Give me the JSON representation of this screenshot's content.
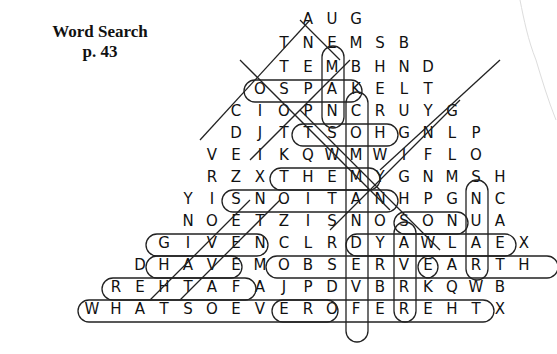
{
  "header": {
    "title": "Word Search",
    "page": "p. 43"
  },
  "puzzle": {
    "rows": [
      {
        "x": 296,
        "y": 8,
        "letters": [
          "A",
          "U",
          "G"
        ]
      },
      {
        "x": 272,
        "y": 32,
        "letters": [
          "T",
          "N",
          "E",
          "M",
          "S",
          "B"
        ]
      },
      {
        "x": 272,
        "y": 56,
        "letters": [
          "T",
          "E",
          "M",
          "B",
          "H",
          "N",
          "D"
        ]
      },
      {
        "x": 248,
        "y": 78,
        "letters": [
          "O",
          "S",
          "P",
          "A",
          "K",
          "E",
          "L",
          "T"
        ]
      },
      {
        "x": 224,
        "y": 100,
        "letters": [
          "C",
          "I",
          "O",
          "P",
          "N",
          "C",
          "R",
          "U",
          "Y",
          "G"
        ]
      },
      {
        "x": 224,
        "y": 122,
        "letters": [
          "D",
          "J",
          "T",
          "T",
          "S",
          "O",
          "H",
          "G",
          "N",
          "L",
          "P"
        ]
      },
      {
        "x": 200,
        "y": 144,
        "letters": [
          "V",
          "E",
          "I",
          "K",
          "Q",
          "W",
          "M",
          "W",
          "I",
          "F",
          "L",
          "O"
        ]
      },
      {
        "x": 200,
        "y": 166,
        "letters": [
          "R",
          "Z",
          "X",
          "T",
          "H",
          "E",
          "M",
          "Y",
          "G",
          "N",
          "M",
          "S",
          "H"
        ]
      },
      {
        "x": 176,
        "y": 188,
        "letters": [
          "Y",
          "I",
          "S",
          "N",
          "O",
          "I",
          "T",
          "A",
          "N",
          "H",
          "P",
          "G",
          "N",
          "C"
        ]
      },
      {
        "x": 176,
        "y": 210,
        "letters": [
          "N",
          "O",
          "E",
          "T",
          "Z",
          "I",
          "S",
          "N",
          "O",
          "S",
          "O",
          "N",
          "U",
          "A"
        ]
      },
      {
        "x": 152,
        "y": 232,
        "letters": [
          "G",
          "I",
          "V",
          "E",
          "N",
          "C",
          "L",
          "R",
          "D",
          "Y",
          "A",
          "W",
          "L",
          "A",
          "E",
          "X"
        ]
      },
      {
        "x": 128,
        "y": 254,
        "letters": [
          "D",
          "H",
          "A",
          "V",
          "E",
          "M",
          "O",
          "B",
          "S",
          "E",
          "R",
          "V",
          "E",
          "A",
          "R",
          "T",
          "H"
        ]
      },
      {
        "x": 104,
        "y": 276,
        "letters": [
          "R",
          "E",
          "H",
          "T",
          "A",
          "F",
          "A",
          "J",
          "P",
          "D",
          "V",
          "B",
          "R",
          "K",
          "Q",
          "W",
          "B"
        ]
      },
      {
        "x": 80,
        "y": 298,
        "letters": [
          "W",
          "H",
          "A",
          "T",
          "S",
          "O",
          "E",
          "V",
          "E",
          "R",
          "O",
          "F",
          "E",
          "R",
          "E",
          "H",
          "T",
          "X"
        ]
      }
    ],
    "found_words": [
      "AUG",
      "TNEM",
      "GIVEN",
      "HAVE",
      "OBSERVE",
      "EARTH",
      "YAWLA",
      "SNOITAN",
      "THEM",
      "TSOHG",
      "OSPAKE",
      "REHTAF",
      "WHATSOEVER",
      "OFEREHT",
      "SON",
      "HCAET",
      "DER"
    ]
  }
}
